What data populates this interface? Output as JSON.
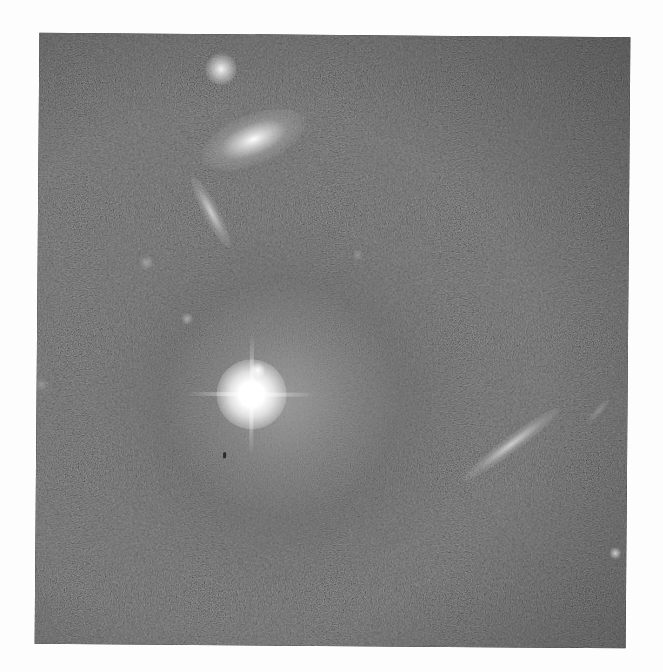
{
  "image": {
    "kind": "astronomical photograph",
    "colorspace": "grayscale",
    "background_color": "#262626",
    "frame": {
      "left": 37,
      "top": 35,
      "width": 591,
      "height": 611,
      "rotation_deg": 0.45
    },
    "objects": [
      {
        "name": "bright-central-galaxy-core",
        "x": 252,
        "y": 397,
        "type": "bright star/galaxy nucleus with diffraction spikes"
      },
      {
        "name": "central-galaxy-halo",
        "x": 260,
        "y": 420,
        "type": "diffuse spiral halo"
      },
      {
        "name": "elliptical-galaxy-top",
        "x": 252,
        "y": 140,
        "type": "elliptical galaxy"
      },
      {
        "name": "compact-source-top",
        "x": 219,
        "y": 70,
        "type": "compact bright source"
      },
      {
        "name": "edge-on-galaxy-upper-left",
        "x": 200,
        "y": 220,
        "type": "edge-on galaxy streak"
      },
      {
        "name": "edge-on-galaxy-lower-right",
        "x": 520,
        "y": 445,
        "type": "edge-on galaxy streak"
      },
      {
        "name": "faint-streak-right-edge",
        "x": 598,
        "y": 412,
        "type": "faint streak"
      },
      {
        "name": "point-source-lower-right",
        "x": 618,
        "y": 552,
        "type": "point source"
      },
      {
        "name": "faint-blob-left",
        "x": 146,
        "y": 264,
        "type": "faint source"
      },
      {
        "name": "faint-blob-mid",
        "x": 187,
        "y": 320,
        "type": "faint source"
      },
      {
        "name": "dust-speck",
        "x": 225,
        "y": 453,
        "type": "dark speck"
      }
    ]
  }
}
